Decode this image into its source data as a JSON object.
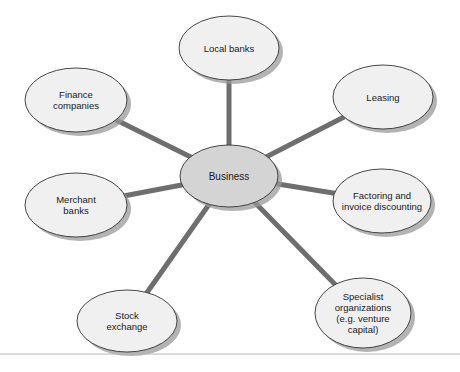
{
  "diagram": {
    "center": {
      "label": "Business",
      "cx": 229,
      "cy": 176,
      "rx": 49,
      "ry": 31,
      "fill": "#d4d4d4"
    },
    "nodes": [
      {
        "id": "local-banks",
        "label": "Local banks",
        "cx": 229,
        "cy": 48,
        "rx": 50,
        "ry": 32
      },
      {
        "id": "finance-companies",
        "label": "Finance\ncompanies",
        "cx": 76,
        "cy": 100,
        "rx": 51,
        "ry": 32
      },
      {
        "id": "leasing",
        "label": "Leasing",
        "cx": 383,
        "cy": 97,
        "rx": 50,
        "ry": 32
      },
      {
        "id": "merchant-banks",
        "label": "Merchant\nbanks",
        "cx": 76,
        "cy": 205,
        "rx": 51,
        "ry": 32
      },
      {
        "id": "factoring",
        "label": "Factoring and\ninvoice discounting",
        "cx": 382,
        "cy": 201,
        "rx": 49,
        "ry": 32
      },
      {
        "id": "stock-exchange",
        "label": "Stock\nexchange",
        "cx": 127,
        "cy": 321,
        "rx": 50,
        "ry": 31
      },
      {
        "id": "specialist-organizations",
        "label": "Specialist\norganizations\n(e.g. venture\ncapital)",
        "cx": 363,
        "cy": 313,
        "rx": 48,
        "ry": 35
      }
    ],
    "node_fill": "#f0f0f0",
    "connector_color": "#6e6e6e",
    "shadow_color": "#9a9a9a",
    "outline_color": "#333333",
    "baseline_y": 354,
    "baseline_color": "#b8b8b8"
  }
}
